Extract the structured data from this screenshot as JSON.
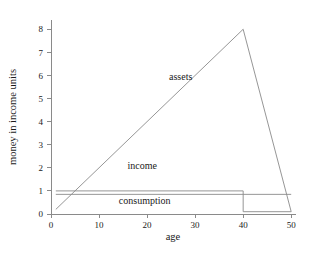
{
  "chart_data": {
    "type": "line",
    "title": "",
    "xlabel": "age",
    "ylabel": "money in income units",
    "xlim": [
      0,
      51
    ],
    "ylim": [
      0,
      8.4
    ],
    "xticks": [
      0,
      10,
      20,
      30,
      40,
      50
    ],
    "yticks": [
      0,
      1,
      2,
      3,
      4,
      5,
      6,
      7,
      8
    ],
    "grid": false,
    "legend_position": "inline-annotations",
    "series": [
      {
        "name": "assets",
        "color": "#8a8a8a",
        "x": [
          1,
          40,
          50
        ],
        "y": [
          0.2,
          8.0,
          0.1
        ]
      },
      {
        "name": "income",
        "color": "#8a8a8a",
        "x": [
          1,
          40,
          40,
          50
        ],
        "y": [
          1.0,
          1.0,
          0.1,
          0.1
        ]
      },
      {
        "name": "consumption",
        "color": "#8a8a8a",
        "x": [
          1,
          50
        ],
        "y": [
          0.85,
          0.85
        ]
      }
    ],
    "annotations": [
      {
        "text": "assets",
        "x": 27.0,
        "y": 5.8
      },
      {
        "text": "income",
        "x": 19.0,
        "y": 1.95
      },
      {
        "text": "consumption",
        "x": 19.5,
        "y": 0.42
      }
    ]
  },
  "axes": {
    "x_tick_labels": [
      "0",
      "10",
      "20",
      "30",
      "40",
      "50"
    ],
    "y_tick_labels": [
      "0",
      "1",
      "2",
      "3",
      "4",
      "5",
      "6",
      "7",
      "8"
    ],
    "x_title": "age",
    "y_title": "money in income units"
  },
  "labels": {
    "assets": "assets",
    "income": "income",
    "consumption": "consumption"
  }
}
